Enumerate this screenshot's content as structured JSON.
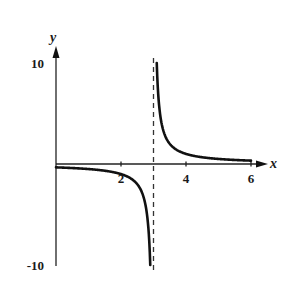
{
  "chart_data": {
    "type": "line",
    "title": "",
    "function": "y = 1/(x - 3)",
    "xlabel": "x",
    "ylabel": "y",
    "xlim": [
      0,
      6.3
    ],
    "ylim": [
      -10,
      10
    ],
    "x_ticks": [
      2,
      4,
      6
    ],
    "x_tick_labels": [
      "2",
      "4",
      "6"
    ],
    "y_ticks": [
      10,
      -10
    ],
    "y_tick_labels": [
      "10",
      "-10"
    ],
    "grid": false,
    "legend": null,
    "vertical_asymptote": {
      "x": 3,
      "style": "dashed"
    },
    "series": [
      {
        "name": "left branch",
        "x": [
          0,
          1,
          2,
          2.5,
          2.8,
          2.9
        ],
        "y": [
          -0.33,
          -0.5,
          -1,
          -2,
          -5,
          -10
        ]
      },
      {
        "name": "right branch",
        "x": [
          3.1,
          3.2,
          3.5,
          4,
          5,
          6
        ],
        "y": [
          10,
          5,
          2,
          1,
          0.5,
          0.33
        ]
      }
    ],
    "colors": {
      "curve": "#111111",
      "axes": "#222222",
      "asymptote": "#333333"
    }
  }
}
